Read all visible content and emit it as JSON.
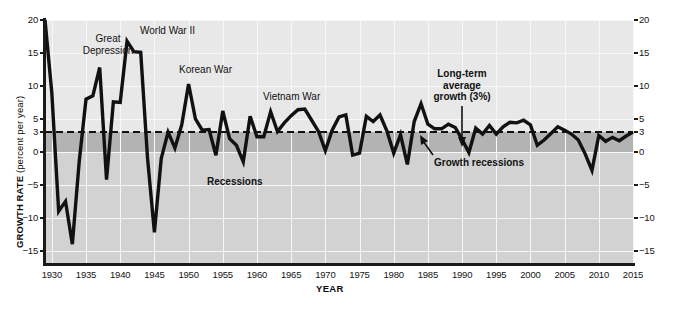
{
  "chart_data": {
    "type": "line",
    "title": "",
    "xlabel": "YEAR",
    "ylabel": "GROWTH RATE",
    "ylabel_unit": "(percent per year)",
    "xlim": [
      1929,
      2015
    ],
    "ylim": [
      -17,
      20
    ],
    "xticks": [
      1930,
      1935,
      1940,
      1945,
      1950,
      1955,
      1960,
      1965,
      1970,
      1975,
      1980,
      1985,
      1990,
      1995,
      2000,
      2005,
      2010,
      2015
    ],
    "yticks": [
      20,
      15,
      10,
      5,
      3,
      0,
      -5,
      -10,
      -15
    ],
    "ytick_labels": [
      "20",
      "15",
      "10",
      "5",
      "3",
      "0",
      "−5",
      "−10",
      "−15"
    ],
    "grid": true,
    "legend": "none",
    "reference_line": {
      "value": 3,
      "label": "Long-term average growth (3%)",
      "style": "dashed"
    },
    "bands": [
      {
        "name": "Recessions",
        "from": -17,
        "to": 0,
        "color": "#d2d2d2"
      },
      {
        "name": "Growth recessions",
        "from": 0,
        "to": 3,
        "color": "#b3b3b3"
      }
    ],
    "series": [
      {
        "name": "Real GDP growth rate",
        "color": "#111111",
        "x": [
          1929,
          1930,
          1931,
          1932,
          1933,
          1934,
          1935,
          1936,
          1937,
          1938,
          1939,
          1940,
          1941,
          1942,
          1943,
          1944,
          1945,
          1946,
          1947,
          1948,
          1949,
          1950,
          1951,
          1952,
          1953,
          1954,
          1955,
          1956,
          1957,
          1958,
          1959,
          1960,
          1961,
          1962,
          1963,
          1964,
          1965,
          1966,
          1967,
          1968,
          1969,
          1970,
          1971,
          1972,
          1973,
          1974,
          1975,
          1976,
          1977,
          1978,
          1979,
          1980,
          1981,
          1982,
          1983,
          1984,
          1985,
          1986,
          1987,
          1988,
          1989,
          1990,
          1991,
          1992,
          1993,
          1994,
          1995,
          1996,
          1997,
          1998,
          1999,
          2000,
          2001,
          2002,
          2003,
          2004,
          2005,
          2006,
          2007,
          2008,
          2009,
          2010,
          2011,
          2012,
          2013,
          2014,
          2015
        ],
        "y": [
          20.0,
          8.9,
          -9.0,
          -7.5,
          -14.0,
          -1.5,
          8.0,
          8.5,
          12.8,
          -4.2,
          7.6,
          7.5,
          16.8,
          15.2,
          15.1,
          -1.0,
          -12.2,
          -1.0,
          3.0,
          0.6,
          4.1,
          10.3,
          5.0,
          3.3,
          3.4,
          -0.5,
          6.2,
          2.0,
          1.0,
          -1.5,
          5.4,
          2.3,
          2.3,
          6.1,
          3.1,
          4.4,
          5.5,
          6.4,
          6.5,
          4.8,
          3.1,
          0.2,
          3.3,
          5.3,
          5.6,
          -0.5,
          -0.2,
          5.4,
          4.6,
          5.6,
          3.2,
          -0.2,
          2.6,
          -1.9,
          4.6,
          7.3,
          4.2,
          3.5,
          3.5,
          4.2,
          3.7,
          1.9,
          -0.1,
          3.6,
          2.7,
          4.0,
          2.7,
          3.8,
          4.5,
          4.4,
          4.8,
          4.1,
          1.0,
          1.8,
          2.8,
          3.8,
          3.3,
          2.7,
          1.8,
          -0.3,
          -2.8,
          2.5,
          1.6,
          2.2,
          1.7,
          2.4,
          3.0
        ]
      }
    ],
    "annotations": [
      {
        "id": "great-depression",
        "text": "Great\nDepression",
        "x": 1933.5,
        "y": 15.5,
        "bold": false
      },
      {
        "id": "world-war-ii",
        "text": "World War II",
        "x": 1940.5,
        "y": 18.5,
        "bold": false
      },
      {
        "id": "korean-war",
        "text": "Korean War",
        "x": 1951.5,
        "y": 13.0,
        "bold": false
      },
      {
        "id": "vietnam-war",
        "text": "Vietnam War",
        "x": 1966.0,
        "y": 9.5,
        "bold": false
      },
      {
        "id": "long-term-average-growth",
        "text": "Long-term\naverage\ngrowth (3%)",
        "x": 1990.0,
        "y": 12.0,
        "bold": true
      },
      {
        "id": "growth-recessions",
        "text": "Growth recessions",
        "x": 1992.0,
        "y": -1.7,
        "bold": true
      },
      {
        "id": "recessions",
        "text": "Recessions",
        "x": 1963.0,
        "y": -8.0,
        "bold": true
      }
    ]
  },
  "labels": {
    "great_depression": "Great\nDepression",
    "great_depression_l1": "Great",
    "great_depression_l2": "Depression",
    "world_war_ii": "World War II",
    "korean_war": "Korean War",
    "vietnam_war": "Vietnam War",
    "lta_l1": "Long-term",
    "lta_l2": "average",
    "lta_l3": "growth (3%)",
    "growth_recessions": "Growth recessions",
    "recessions": "Recessions",
    "x_axis_title": "YEAR",
    "y_axis_title": "GROWTH RATE",
    "y_axis_unit": " (percent per year)"
  }
}
